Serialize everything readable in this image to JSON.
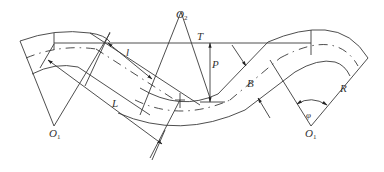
{
  "diagram": {
    "type": "channel meander (bend) geometry",
    "labels": {
      "O1_left": {
        "main": "O",
        "sub": "1"
      },
      "O2": {
        "main": "O",
        "sub": "2"
      },
      "O1_right": {
        "main": "O",
        "sub": "1"
      },
      "T": "T",
      "P": "P",
      "B": "B",
      "l": "l",
      "L": "L",
      "R": "R",
      "phi": "φ"
    },
    "colors": {
      "line": "#3a3a3a",
      "background": "#ffffff"
    }
  }
}
